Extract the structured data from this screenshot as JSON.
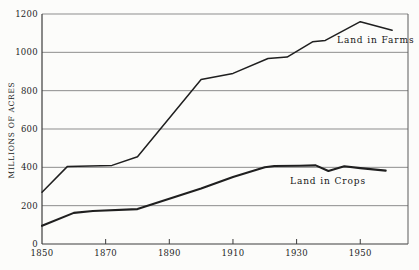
{
  "chart_data": {
    "type": "line",
    "title": "",
    "xlabel": "",
    "ylabel": "MILLIONS OF ACRES",
    "xlim": [
      1850,
      1965
    ],
    "ylim": [
      0,
      1200
    ],
    "x_ticks": [
      1850,
      1870,
      1890,
      1910,
      1930,
      1950
    ],
    "y_ticks": [
      0,
      200,
      400,
      600,
      800,
      1000,
      1200
    ],
    "grid": "horizontal",
    "legend_position": "inline-annotations",
    "colors": {
      "line": "#1f1f1f",
      "gridline": "#8d8d8d",
      "axis": "#3c3c3c",
      "background": "#fcfcfa"
    },
    "series": [
      {
        "name": "Land in Farms",
        "points": [
          [
            1850,
            270
          ],
          [
            1858,
            405
          ],
          [
            1872,
            410
          ],
          [
            1880,
            455
          ],
          [
            1900,
            858
          ],
          [
            1910,
            890
          ],
          [
            1921,
            968
          ],
          [
            1927,
            975
          ],
          [
            1935,
            1055
          ],
          [
            1939,
            1062
          ],
          [
            1950,
            1160
          ],
          [
            1960,
            1115
          ]
        ]
      },
      {
        "name": "Land in Crops",
        "points": [
          [
            1850,
            95
          ],
          [
            1860,
            162
          ],
          [
            1866,
            172
          ],
          [
            1880,
            182
          ],
          [
            1900,
            290
          ],
          [
            1910,
            350
          ],
          [
            1920,
            400
          ],
          [
            1923,
            407
          ],
          [
            1931,
            408
          ],
          [
            1936,
            410
          ],
          [
            1940,
            381
          ],
          [
            1945,
            406
          ],
          [
            1950,
            396
          ],
          [
            1958,
            383
          ]
        ]
      }
    ]
  }
}
